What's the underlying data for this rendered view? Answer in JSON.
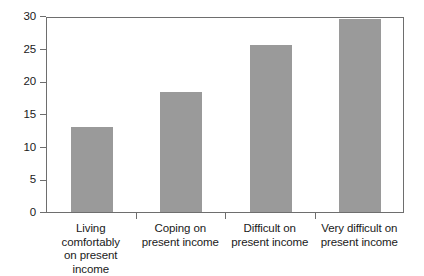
{
  "chart_data": {
    "type": "bar",
    "title": "",
    "subtitle": "",
    "xlabel": "",
    "ylabel": "",
    "categories": [
      "Living comfortably on present income",
      "Coping on present income",
      "Difficult on present income",
      "Very difficult on present income"
    ],
    "category_lines": [
      [
        "Living comfortably",
        "on present income"
      ],
      [
        "Coping on",
        "present income"
      ],
      [
        "Difficult on",
        "present income"
      ],
      [
        "Very difficult on",
        "present income"
      ]
    ],
    "values": [
      13.0,
      18.3,
      25.6,
      29.6
    ],
    "ylim": [
      0,
      30
    ],
    "yticks": [
      0,
      5,
      10,
      15,
      20,
      25,
      30
    ],
    "ytick_labels": [
      "0",
      "5",
      "10",
      "15",
      "20",
      "25",
      "30"
    ],
    "grid": false,
    "legend": false,
    "legend_position": "none",
    "bar_color": "#9a9a9a",
    "axis_color": "#6e6e6e",
    "background": "#ffffff"
  }
}
